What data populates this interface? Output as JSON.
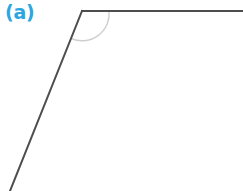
{
  "figure": {
    "panel_label": "(a)",
    "label_color": "#2ba6e0",
    "background_color": "#ffffff",
    "ray_color": "#4d4d4d",
    "arc_color": "#cfcfcf",
    "canvas": {
      "width": 243,
      "height": 191
    },
    "vertex": {
      "x": 82,
      "y": 11
    },
    "rays": [
      {
        "name": "horizontal-ray",
        "from": {
          "x": 82,
          "y": 11
        },
        "to": {
          "x": 243,
          "y": 11
        },
        "stroke_width": 2.0
      },
      {
        "name": "diagonal-ray",
        "from": {
          "x": 82,
          "y": 11
        },
        "to": {
          "x": 10,
          "y": 191
        },
        "stroke_width": 2.0
      }
    ],
    "angle_arc": {
      "name": "interior-angle-arc",
      "radius": 27,
      "start": {
        "x": 109,
        "y": 11
      },
      "end": {
        "x": 71.2,
        "y": 38.5
      },
      "stroke_width": 1.4,
      "sweep": "clockwise-interior"
    }
  }
}
